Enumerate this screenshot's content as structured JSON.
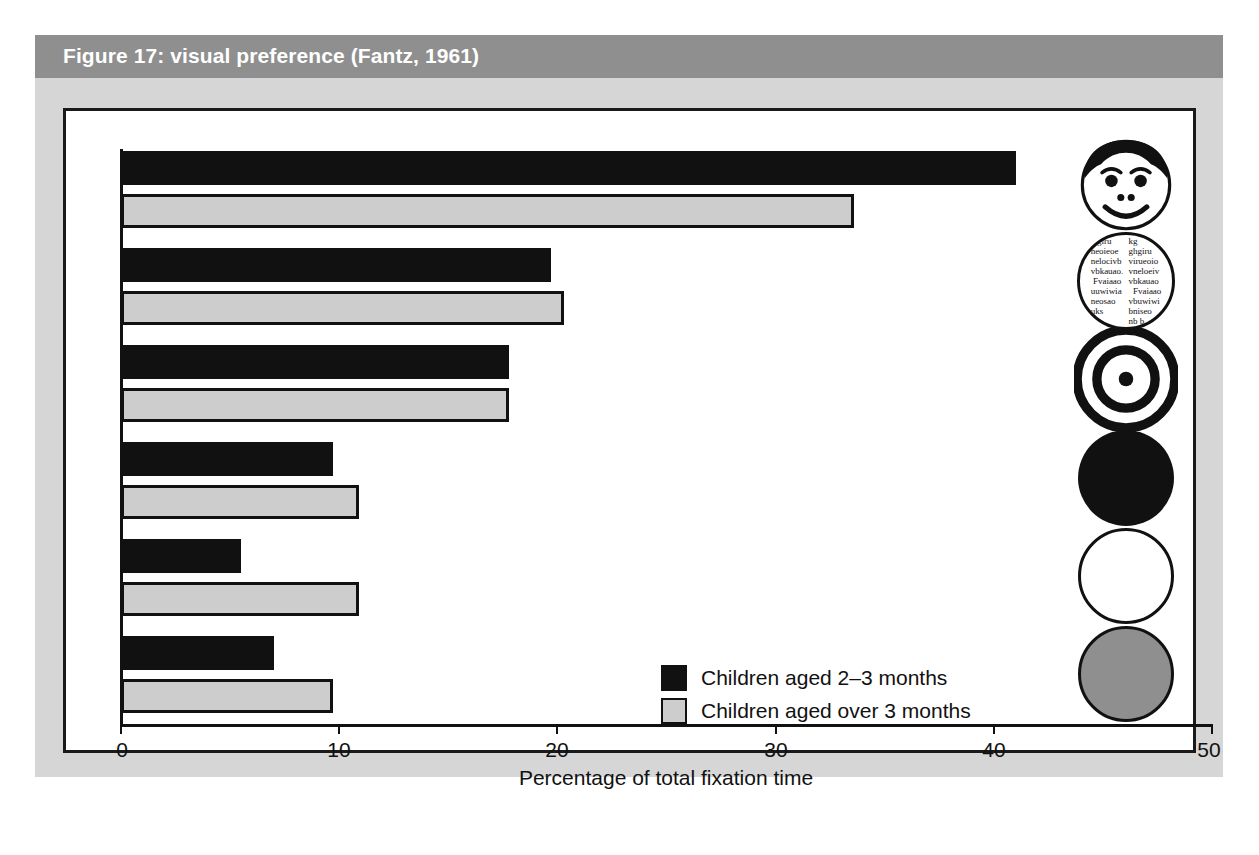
{
  "figure": {
    "title": "Figure 17: visual preference (Fantz, 1961)",
    "title_bar_color": "#8f8f8f",
    "panel_color": "#d6d6d6"
  },
  "legend": {
    "position": "inside-lower-right",
    "entries": [
      {
        "label": "Children aged 2–3 months",
        "color": "#111111",
        "icon": "dark-swatch"
      },
      {
        "label": "Children aged over 3 months",
        "color": "#cdcdcd",
        "icon": "light-swatch"
      }
    ]
  },
  "axis": {
    "x_label": "Percentage of total fixation time",
    "x_ticks": [
      "0",
      "10",
      "20",
      "30",
      "40",
      "50"
    ],
    "x_min": 0,
    "x_max": 50
  },
  "stimuli": [
    {
      "name": "face",
      "caption": "schematic human face",
      "icon": "face-icon"
    },
    {
      "name": "printed-text",
      "caption": "printed text / newsprint",
      "icon": "print-icon",
      "column_left": "algiru\nneoieoe\nnelocivb\nvbkauao.\n Fvaiaao\nuuwiwia\nneosao\nuks",
      "column_right": "kg\nghgiru\nvirueoio\nvneloeiv\nvbkauao\n  Fvaiaao\nvbuwiwi\nbniseo\nnb b"
    },
    {
      "name": "bullseye",
      "caption": "concentric rings (bullseye)",
      "icon": "bullseye-icon"
    },
    {
      "name": "black-disc",
      "caption": "plain black circle",
      "icon": "black-circle-icon"
    },
    {
      "name": "white-disc",
      "caption": "plain white circle",
      "icon": "white-circle-icon"
    },
    {
      "name": "gray-disc",
      "caption": "plain grey circle",
      "icon": "gray-circle-icon"
    }
  ],
  "chart_data": {
    "type": "bar",
    "orientation": "horizontal",
    "title": "Figure 17: visual preference (Fantz, 1961)",
    "xlabel": "Percentage of total fixation time",
    "ylabel": "",
    "xlim": [
      0,
      50
    ],
    "xticks": [
      0,
      10,
      20,
      30,
      40,
      50
    ],
    "grid": false,
    "legend_position": "inside lower right",
    "categories": [
      "Face",
      "Printed text",
      "Bullseye",
      "Black circle",
      "White circle",
      "Grey circle"
    ],
    "series": [
      {
        "name": "Children aged 2–3 months",
        "color": "#111111",
        "values": [
          41.0,
          19.7,
          17.8,
          9.7,
          5.5,
          7.0
        ]
      },
      {
        "name": "Children aged over 3 months",
        "color": "#cdcdcd",
        "values": [
          33.6,
          20.3,
          17.8,
          10.9,
          10.9,
          9.7
        ]
      }
    ]
  }
}
